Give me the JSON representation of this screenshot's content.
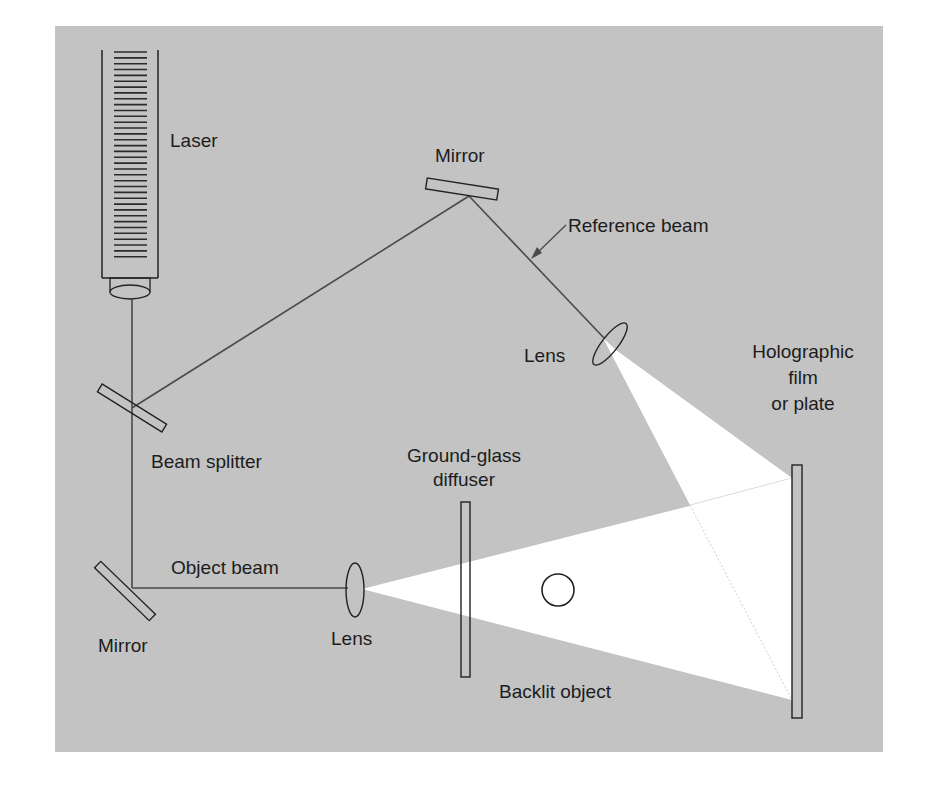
{
  "diagram": {
    "type": "holography-setup",
    "colors": {
      "background": "#ffffff",
      "panel": "#c3c3c3",
      "stroke": "#222222",
      "beam": "#4a4a4a",
      "light": "#ffffff"
    },
    "labels": {
      "laser": "Laser",
      "mirror_top": "Mirror",
      "reference_beam": "Reference beam",
      "lens_top": "Lens",
      "holographic_line1": "Holographic",
      "holographic_line2": "film",
      "holographic_line3": "or plate",
      "beam_splitter": "Beam splitter",
      "ground_glass_line1": "Ground-glass",
      "ground_glass_line2": "diffuser",
      "object_beam": "Object beam",
      "mirror_bottom": "Mirror",
      "lens_bottom": "Lens",
      "backlit_object": "Backlit object"
    },
    "components": [
      {
        "name": "Laser",
        "kind": "source"
      },
      {
        "name": "Beam splitter",
        "kind": "optic"
      },
      {
        "name": "Mirror (top)",
        "kind": "optic"
      },
      {
        "name": "Mirror (bottom)",
        "kind": "optic"
      },
      {
        "name": "Lens (reference)",
        "kind": "optic"
      },
      {
        "name": "Lens (object)",
        "kind": "optic"
      },
      {
        "name": "Ground-glass diffuser",
        "kind": "optic"
      },
      {
        "name": "Backlit object",
        "kind": "subject"
      },
      {
        "name": "Holographic film or plate",
        "kind": "detector"
      }
    ]
  }
}
